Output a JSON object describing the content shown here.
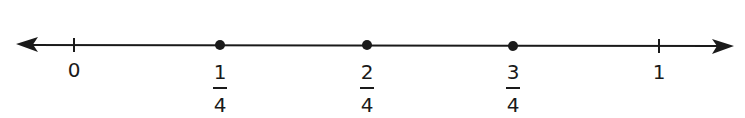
{
  "number_line": {
    "line_color": "#1a1a1a",
    "range": [
      0,
      1
    ],
    "ticks": [
      {
        "value": 0,
        "x": 74,
        "label": "0",
        "type": "tick"
      },
      {
        "value": 0.25,
        "x": 220,
        "numerator": "1",
        "denominator": "4",
        "type": "point"
      },
      {
        "value": 0.5,
        "x": 367,
        "numerator": "2",
        "denominator": "4",
        "type": "point"
      },
      {
        "value": 0.75,
        "x": 513,
        "numerator": "3",
        "denominator": "4",
        "type": "point"
      },
      {
        "value": 1,
        "x": 659,
        "label": "1",
        "type": "tick"
      }
    ],
    "arrows": [
      "left",
      "right"
    ]
  }
}
